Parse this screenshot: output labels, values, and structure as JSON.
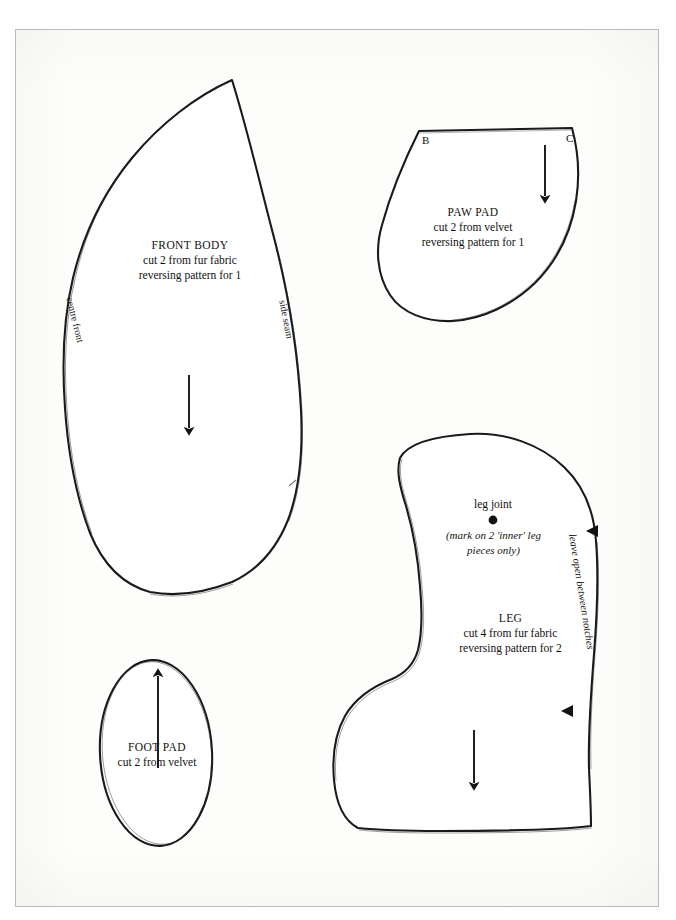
{
  "document": {
    "type": "sewing-pattern-sheet",
    "ink_color": "#1a1a1a",
    "paper_color": "#fdfdfc",
    "background_color": "#ffffff"
  },
  "pieces": {
    "front_body": {
      "title": "FRONT BODY",
      "line2": "cut 2 from fur fabric",
      "line3": "reversing pattern for 1",
      "edge_left_label": "centre front",
      "edge_right_label": "side seam",
      "grainline_direction": "down"
    },
    "paw_pad": {
      "title": "PAW PAD",
      "line2": "cut 2 from velvet",
      "line3": "reversing pattern for 1",
      "corner_left_label": "B",
      "corner_right_label": "C",
      "grainline_direction": "down"
    },
    "leg": {
      "title": "LEG",
      "line2": "cut 4 from fur fabric",
      "line3": "reversing pattern for 2",
      "joint_label": "leg joint",
      "joint_note_line1": "(mark on 2 'inner' leg",
      "joint_note_line2": "pieces only)",
      "opening_label": "leave open between notches",
      "grainline_direction": "down",
      "notch_count": 2
    },
    "foot_pad": {
      "title": "FOOT PAD",
      "line2": "cut 2 from velvet",
      "grainline_direction": "up"
    }
  }
}
